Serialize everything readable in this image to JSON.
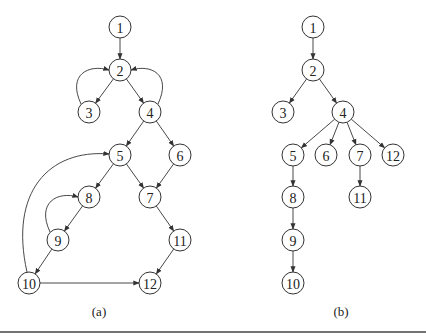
{
  "figure": {
    "panels": [
      {
        "id": "a",
        "caption": "(a)",
        "caption_pos": [
          99,
          316
        ],
        "nodes": [
          {
            "label": "1",
            "x": 120,
            "y": 27
          },
          {
            "label": "2",
            "x": 120,
            "y": 70
          },
          {
            "label": "3",
            "x": 89,
            "y": 112
          },
          {
            "label": "4",
            "x": 150,
            "y": 112
          },
          {
            "label": "5",
            "x": 120,
            "y": 155
          },
          {
            "label": "6",
            "x": 180,
            "y": 155
          },
          {
            "label": "7",
            "x": 150,
            "y": 197
          },
          {
            "label": "8",
            "x": 89,
            "y": 197
          },
          {
            "label": "9",
            "x": 58,
            "y": 240
          },
          {
            "label": "10",
            "x": 29,
            "y": 283
          },
          {
            "label": "11",
            "x": 180,
            "y": 240
          },
          {
            "label": "12",
            "x": 150,
            "y": 283
          }
        ],
        "edges": [
          {
            "from": "1",
            "to": "2"
          },
          {
            "from": "2",
            "to": "3"
          },
          {
            "from": "2",
            "to": "4"
          },
          {
            "from": "3",
            "to": "2",
            "curved": true
          },
          {
            "from": "4",
            "to": "2",
            "curved": true
          },
          {
            "from": "4",
            "to": "5"
          },
          {
            "from": "4",
            "to": "6"
          },
          {
            "from": "5",
            "to": "8"
          },
          {
            "from": "5",
            "to": "7"
          },
          {
            "from": "6",
            "to": "7"
          },
          {
            "from": "8",
            "to": "9"
          },
          {
            "from": "9",
            "to": "8",
            "curved": true
          },
          {
            "from": "9",
            "to": "10"
          },
          {
            "from": "10",
            "to": "5",
            "curved": true
          },
          {
            "from": "10",
            "to": "12"
          },
          {
            "from": "7",
            "to": "11"
          },
          {
            "from": "11",
            "to": "12"
          }
        ]
      },
      {
        "id": "b",
        "caption": "(b)",
        "caption_pos": [
          341,
          316
        ],
        "nodes": [
          {
            "label": "1",
            "x": 313,
            "y": 27
          },
          {
            "label": "2",
            "x": 313,
            "y": 70
          },
          {
            "label": "3",
            "x": 283,
            "y": 112
          },
          {
            "label": "4",
            "x": 343,
            "y": 112
          },
          {
            "label": "5",
            "x": 293,
            "y": 155
          },
          {
            "label": "6",
            "x": 326,
            "y": 155
          },
          {
            "label": "7",
            "x": 360,
            "y": 155
          },
          {
            "label": "12",
            "x": 393,
            "y": 155
          },
          {
            "label": "8",
            "x": 293,
            "y": 197
          },
          {
            "label": "11",
            "x": 360,
            "y": 197
          },
          {
            "label": "9",
            "x": 293,
            "y": 240
          },
          {
            "label": "10",
            "x": 293,
            "y": 283
          }
        ],
        "edges": [
          {
            "from": "1",
            "to": "2"
          },
          {
            "from": "2",
            "to": "3"
          },
          {
            "from": "2",
            "to": "4"
          },
          {
            "from": "4",
            "to": "5"
          },
          {
            "from": "4",
            "to": "6"
          },
          {
            "from": "4",
            "to": "7"
          },
          {
            "from": "4",
            "to": "12"
          },
          {
            "from": "5",
            "to": "8"
          },
          {
            "from": "8",
            "to": "9"
          },
          {
            "from": "9",
            "to": "10"
          },
          {
            "from": "7",
            "to": "11"
          }
        ]
      }
    ]
  }
}
